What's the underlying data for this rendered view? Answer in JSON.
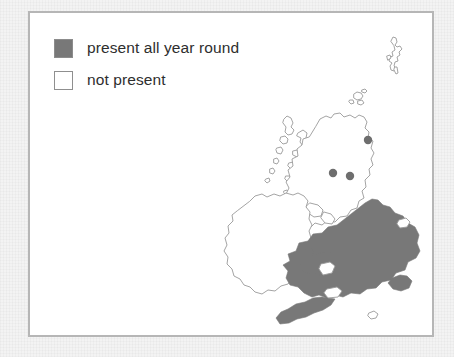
{
  "page": {
    "background_color": "#f3f3f3",
    "panel_background": "#ffffff",
    "panel_border_color": "#b6b6b6"
  },
  "legend": {
    "items": [
      {
        "label": "present all year round",
        "swatch": "filled-gray-square",
        "color": "#787878"
      },
      {
        "label": "not present",
        "swatch": "empty-white-square",
        "color": "#ffffff"
      }
    ]
  },
  "map": {
    "title": "",
    "region": "British Isles",
    "landmasses": [
      {
        "name": "Great Britain",
        "status": "mixed"
      },
      {
        "name": "Ireland",
        "status": "not present"
      },
      {
        "name": "Shetland Islands",
        "status": "not present"
      },
      {
        "name": "Orkney Islands",
        "status": "not present"
      },
      {
        "name": "Outer Hebrides",
        "status": "not present"
      },
      {
        "name": "Isle of Man",
        "status": "not present"
      },
      {
        "name": "Isle of Wight",
        "status": "not present"
      },
      {
        "name": "Anglesey",
        "status": "present all year round"
      }
    ],
    "shaded_area": {
      "label": "present all year round",
      "description": "England and Wales shaded",
      "color": "#787878"
    },
    "unshaded_area": {
      "label": "not present",
      "description": "Scotland, Ireland and outlying islands unshaded",
      "color": "#ffffff"
    },
    "point_records": [
      {
        "name": "record-point-aberdeen",
        "x": 188,
        "y": 119
      },
      {
        "name": "record-point-glasgow",
        "x": 153,
        "y": 152
      },
      {
        "name": "record-point-edinburgh",
        "x": 170,
        "y": 155
      }
    ],
    "outline_color": "#9a9a9a",
    "point_color": "#6e6e6e"
  }
}
